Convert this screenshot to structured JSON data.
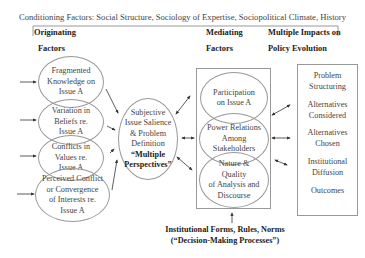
{
  "title": "Conditioning Factors: Social Structure, Sociology of Expertise, Sociopolitical Climate, History",
  "headers": {
    "originating": {
      "line1": "Originating",
      "line2": "Factors"
    },
    "mediating": {
      "line1": "Mediating",
      "line2": "Factors"
    },
    "impacts": {
      "line1": "Multiple Impacts on",
      "line2": "Policy Evolution"
    }
  },
  "originating_factors": [
    {
      "lines": [
        "Fragmented",
        "Knowledge on",
        "Issue A"
      ]
    },
    {
      "lines": [
        "Variation in",
        "Beliefs re.",
        "Issue A"
      ]
    },
    {
      "lines": [
        "Conflicts in",
        "Values re.",
        "Issue A"
      ]
    },
    {
      "lines": [
        "Perceived Conflict",
        "or Convergence",
        "of Interests re.",
        "Issue A"
      ]
    }
  ],
  "central": {
    "lines": [
      "Subjective",
      "Issue Salience",
      "& Problem",
      "Definition"
    ],
    "emphasis": [
      "“Multiple",
      "Perspectives”"
    ]
  },
  "mediating_factors": [
    {
      "lines": [
        "Participation",
        "on Issue A"
      ]
    },
    {
      "lines": [
        "Power Relations",
        "Among",
        "Stakeholders"
      ]
    },
    {
      "lines": [
        "Nature &",
        "Quality",
        "of Analysis and",
        "Discourse"
      ]
    }
  ],
  "impacts": [
    {
      "lines": [
        "Problem",
        "Structuring"
      ]
    },
    {
      "lines": [
        "Alternatives",
        "Considered"
      ]
    },
    {
      "lines": [
        "Alternatives",
        "Chosen"
      ]
    },
    {
      "lines": [
        "Institutional",
        "Diffusion"
      ]
    },
    {
      "lines": [
        "Outcomes"
      ]
    }
  ],
  "institutional": {
    "line1": "Institutional Forms, Rules, Norms",
    "line2": "(“Decision-Making Processes”)"
  },
  "colors": {
    "line": "#999999",
    "arrow": "#333333",
    "text": "#444444"
  }
}
